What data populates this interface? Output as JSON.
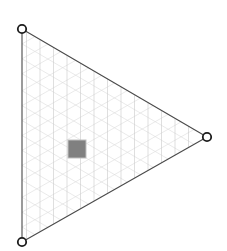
{
  "canvas": {
    "width": 227,
    "height": 251,
    "background_color": "#ffffff"
  },
  "shape": {
    "name": "triangle-mesh",
    "type": "triangle",
    "outline_color": "#4a4a4a",
    "outline_width": 1.1,
    "fill_color": "none",
    "vertices": [
      {
        "id": "top-left",
        "x": 22,
        "y": 29
      },
      {
        "id": "right-apex",
        "x": 207,
        "y": 137
      },
      {
        "id": "bottom-left",
        "x": 22,
        "y": 242
      }
    ]
  },
  "grid": {
    "vertical_color": "#c9c9c9",
    "diagonal_color": "#dcdcdc",
    "line_width": 0.6,
    "vertical_count": 13,
    "vertical_spacing": 13.5,
    "diagonal_count": 13,
    "vertical_x_positions": [
      26.5,
      40.0,
      53.5,
      67.0,
      80.5,
      94.0,
      107.5,
      121.0,
      134.5,
      148.0,
      161.5,
      175.0,
      188.5
    ],
    "diagonal_fractions": [
      0.07,
      0.14,
      0.21,
      0.29,
      0.36,
      0.43,
      0.5,
      0.57,
      0.64,
      0.71,
      0.79,
      0.86,
      0.93
    ]
  },
  "handles": {
    "marker_type": "circle-ring",
    "radius": 4.2,
    "ring_width": 1.8,
    "ring_color": "#1c1c1c",
    "fill_color": "#ffffff",
    "points": [
      {
        "label": "vertex-handle-top-left",
        "x": 22,
        "y": 29
      },
      {
        "label": "vertex-handle-right",
        "x": 207,
        "y": 137
      },
      {
        "label": "vertex-handle-bottom-left",
        "x": 22,
        "y": 242
      }
    ]
  },
  "marker_square": {
    "label": "center-marker-square",
    "x": 68,
    "y": 140,
    "width": 18,
    "height": 18,
    "fill_color": "#808080",
    "stroke_color": "#bfbfbf",
    "stroke_width": 1
  }
}
